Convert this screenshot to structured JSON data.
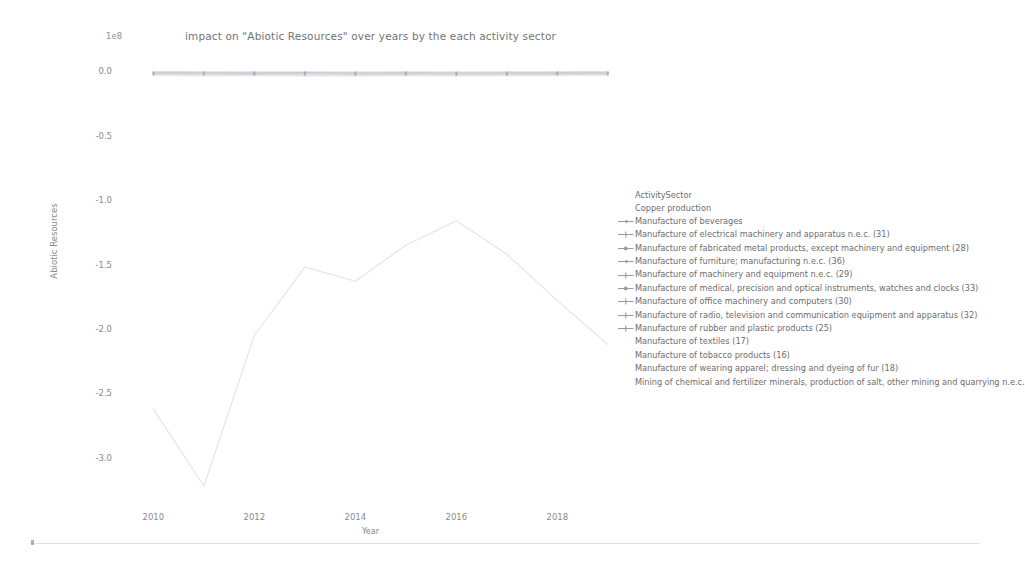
{
  "chart_data": {
    "type": "line",
    "title": "impact on \"Abiotic Resources\" over years by the each activity sector",
    "xlabel": "Year",
    "ylabel": "Abiotic Resources",
    "y_offset_label": "1e8",
    "xlim": [
      2009.3,
      2019.3
    ],
    "ylim": [
      -3.35,
      0.18
    ],
    "xticks": [
      2010,
      2012,
      2014,
      2016,
      2018
    ],
    "xticklabels": [
      "2010",
      "2012",
      "2014",
      "2016",
      "2018"
    ],
    "yticks": [
      0.0,
      -0.5,
      -1.0,
      -1.5,
      -2.0,
      -2.5,
      -3.0
    ],
    "yticklabels": [
      "0.0",
      "-0.5",
      "-1.0",
      "-1.5",
      "-2.0",
      "-2.5",
      "-3.0"
    ],
    "grid": false,
    "legend_position": "right",
    "legend_title": "ActivitySector",
    "x": [
      2010,
      2011,
      2012,
      2013,
      2014,
      2015,
      2016,
      2017,
      2018,
      2019
    ],
    "series": [
      {
        "name": "Copper production",
        "marker": "none",
        "color": "#b9bcc8",
        "values": [
          -2.62,
          -3.22,
          -2.05,
          -1.52,
          -1.63,
          -1.35,
          -1.16,
          -1.42,
          -1.78,
          -2.12
        ]
      },
      {
        "name": "Manufacture of beverages",
        "marker": "tri",
        "color": "#9aa0ad",
        "values": [
          -0.016,
          -0.017,
          -0.018,
          -0.017,
          -0.019,
          -0.018,
          -0.02,
          -0.019,
          -0.018,
          -0.017
        ]
      },
      {
        "name": "Manufacture of electrical machinery and apparatus n.e.c. (31)",
        "marker": "plus",
        "color": "#9aa0ad",
        "values": [
          -0.022,
          -0.024,
          -0.023,
          -0.025,
          -0.026,
          -0.024,
          -0.025,
          -0.024,
          -0.023,
          -0.022
        ]
      },
      {
        "name": "Manufacture of fabricated metal products, except machinery and equipment (28)",
        "marker": "dot",
        "color": "#9aa0ad",
        "values": [
          -0.03,
          -0.032,
          -0.031,
          -0.034,
          -0.033,
          -0.032,
          -0.034,
          -0.033,
          -0.031,
          -0.03
        ]
      },
      {
        "name": "Manufacture of furniture; manufacturing n.e.c. (36)",
        "marker": "tri",
        "color": "#9aa0ad",
        "values": [
          -0.012,
          -0.013,
          -0.014,
          -0.013,
          -0.015,
          -0.014,
          -0.015,
          -0.014,
          -0.013,
          -0.012
        ]
      },
      {
        "name": "Manufacture of machinery and equipment n.e.c. (29)",
        "marker": "plus",
        "color": "#9aa0ad",
        "values": [
          -0.026,
          -0.028,
          -0.027,
          -0.029,
          -0.03,
          -0.028,
          -0.029,
          -0.028,
          -0.027,
          -0.026
        ]
      },
      {
        "name": "Manufacture of medical, precision and optical instruments, watches and clocks (33)",
        "marker": "dot",
        "color": "#9aa0ad",
        "values": [
          -0.008,
          -0.009,
          -0.01,
          -0.009,
          -0.011,
          -0.01,
          -0.011,
          -0.01,
          -0.009,
          -0.008
        ]
      },
      {
        "name": "Manufacture of office machinery and computers (30)",
        "marker": "plus",
        "color": "#9aa0ad",
        "values": [
          -0.005,
          -0.006,
          -0.006,
          -0.007,
          -0.007,
          -0.006,
          -0.007,
          -0.006,
          -0.006,
          -0.005
        ]
      },
      {
        "name": "Manufacture of radio, television and communication equipment and apparatus (32)",
        "marker": "plus",
        "color": "#9aa0ad",
        "values": [
          -0.014,
          -0.015,
          -0.016,
          -0.015,
          -0.017,
          -0.016,
          -0.017,
          -0.016,
          -0.015,
          -0.014
        ]
      },
      {
        "name": "Manufacture of rubber and plastic products (25)",
        "marker": "plus",
        "color": "#9aa0ad",
        "values": [
          -0.019,
          -0.02,
          -0.021,
          -0.02,
          -0.022,
          -0.021,
          -0.022,
          -0.021,
          -0.02,
          -0.019
        ]
      },
      {
        "name": "Manufacture of textiles (17)",
        "marker": "none",
        "color": "#b9bcc8",
        "values": [
          -0.01,
          -0.011,
          -0.012,
          -0.011,
          -0.012,
          -0.011,
          -0.012,
          -0.011,
          -0.011,
          -0.01
        ]
      },
      {
        "name": "Manufacture of tobacco products (16)",
        "marker": "none",
        "color": "#b9bcc8",
        "values": [
          -0.003,
          -0.003,
          -0.004,
          -0.003,
          -0.004,
          -0.004,
          -0.004,
          -0.003,
          -0.003,
          -0.003
        ]
      },
      {
        "name": "Manufacture of wearing apparel; dressing and dyeing of fur (18)",
        "marker": "none",
        "color": "#b9bcc8",
        "values": [
          -0.006,
          -0.007,
          -0.007,
          -0.008,
          -0.008,
          -0.007,
          -0.008,
          -0.007,
          -0.007,
          -0.006
        ]
      },
      {
        "name": "Mining of chemical and fertilizer minerals, production of salt, other mining and quarrying n.e.c.",
        "marker": "none",
        "color": "#b9bcc8",
        "values": [
          -0.035,
          -0.038,
          -0.036,
          -0.04,
          -0.039,
          -0.037,
          -0.04,
          -0.038,
          -0.036,
          -0.035
        ]
      }
    ]
  }
}
